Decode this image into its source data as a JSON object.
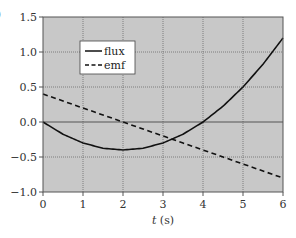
{
  "panel_label": ")",
  "chart_data": {
    "type": "line",
    "title": "",
    "xlabel": "t (s)",
    "xlabel_var": "t",
    "xlabel_unit": " (s)",
    "ylabel": "",
    "xlim": [
      0,
      6
    ],
    "ylim": [
      -1.0,
      1.5
    ],
    "xticks": [
      0,
      1,
      2,
      3,
      4,
      5,
      6
    ],
    "xtick_labels": [
      "0",
      "1",
      "2",
      "3",
      "4",
      "5",
      "6"
    ],
    "yticks": [
      -1.0,
      -0.5,
      0.0,
      0.5,
      1.0,
      1.5
    ],
    "ytick_labels": [
      "−1.0",
      "−0.5",
      "0.0",
      "0.5",
      "1.0",
      "1.5"
    ],
    "grid": true,
    "background": "#c8c8c8",
    "legend_position": "upper left (inside, offset)",
    "x": [
      0,
      0.5,
      1,
      1.5,
      2,
      2.5,
      3,
      3.5,
      4,
      4.5,
      5,
      5.5,
      6
    ],
    "series": [
      {
        "name": "flux",
        "style": "solid",
        "color": "#111111",
        "values": [
          0.0,
          -0.175,
          -0.3,
          -0.375,
          -0.4,
          -0.375,
          -0.3,
          -0.175,
          0.0,
          0.225,
          0.5,
          0.825,
          1.2
        ]
      },
      {
        "name": "emf",
        "style": "dashed",
        "color": "#111111",
        "values": [
          0.4,
          0.3,
          0.2,
          0.1,
          0.0,
          -0.1,
          -0.2,
          -0.3,
          -0.4,
          -0.5,
          -0.6,
          -0.7,
          -0.8
        ]
      }
    ]
  }
}
